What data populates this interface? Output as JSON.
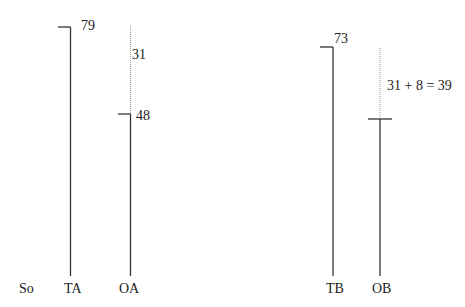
{
  "diagram": {
    "axis_labels": {
      "start": "So",
      "ta": "TA",
      "oa": "OA",
      "tb": "TB",
      "ob": "OB"
    },
    "values": {
      "ta_top": "79",
      "oa_gap": "31",
      "oa_mark": "48",
      "tb_top": "73",
      "ob_gap": "31 + 8 = 39"
    },
    "colors": {
      "line": "#333333",
      "dotted": "#999999",
      "text": "#222222"
    }
  }
}
